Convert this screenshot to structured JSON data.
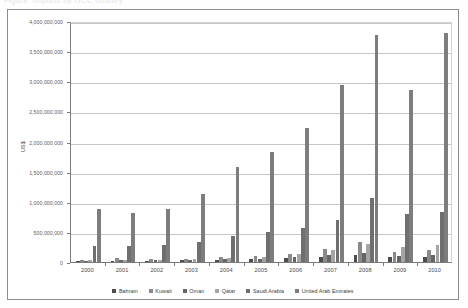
{
  "caption": {
    "text": "Figure: Imports by GCC country"
  },
  "chart_data": {
    "type": "bar",
    "title": "",
    "subtitle": "",
    "xlabel": "",
    "ylabel": "US$",
    "grid": true,
    "legend_position": "bottom",
    "categories": [
      "2000",
      "2001",
      "2002",
      "2003",
      "2004",
      "2005",
      "2006",
      "2007",
      "2008",
      "2009",
      "2010"
    ],
    "ylim": [
      0,
      4000000000
    ],
    "ytick_values": [
      0,
      500000000,
      1000000000,
      1500000000,
      2000000000,
      2500000000,
      3000000000,
      3500000000,
      4000000000
    ],
    "ytick_labels": [
      "0",
      "500,000,000",
      "1,000,000,000",
      "1,500,000,000",
      "2,000,000,000",
      "2,500,000,000",
      "3,000,000,000",
      "3,500,000,000",
      "4,000,000,000"
    ],
    "series": [
      {
        "name": "Bahrain",
        "color": "#4d4d4d",
        "values": [
          18000000,
          22000000,
          24000000,
          30000000,
          38000000,
          45000000,
          60000000,
          80000000,
          120000000,
          75000000,
          90000000
        ]
      },
      {
        "name": "Kuwait",
        "color": "#8a8a8a",
        "values": [
          40000000,
          70000000,
          45000000,
          55000000,
          85000000,
          100000000,
          140000000,
          220000000,
          330000000,
          170000000,
          200000000
        ]
      },
      {
        "name": "Oman",
        "color": "#656565",
        "values": [
          25000000,
          30000000,
          28000000,
          35000000,
          42000000,
          55000000,
          75000000,
          110000000,
          150000000,
          100000000,
          115000000
        ]
      },
      {
        "name": "Qatar",
        "color": "#a5a5a5",
        "values": [
          30000000,
          38000000,
          34000000,
          45000000,
          60000000,
          90000000,
          130000000,
          200000000,
          300000000,
          250000000,
          290000000
        ]
      },
      {
        "name": "Saudi Arabia",
        "color": "#6f6f6f",
        "values": [
          260000000,
          270000000,
          280000000,
          330000000,
          430000000,
          490000000,
          560000000,
          690000000,
          1070000000,
          800000000,
          830000000
        ]
      },
      {
        "name": "United Arab Emirates",
        "color": "#7d7d7d",
        "values": [
          880000000,
          820000000,
          880000000,
          1130000000,
          1570000000,
          1830000000,
          2230000000,
          2940000000,
          3760000000,
          2850000000,
          3800000000
        ]
      }
    ]
  }
}
